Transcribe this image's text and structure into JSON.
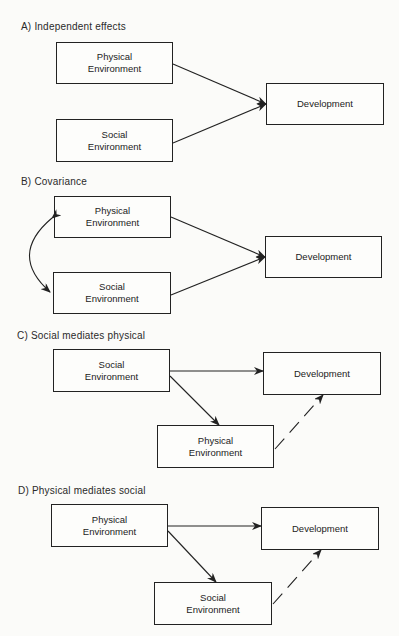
{
  "panels": [
    {
      "label": "A)  Independent effects",
      "boxes": {
        "physical": [
          "Physical",
          "Environment"
        ],
        "social": [
          "Social",
          "Environment"
        ],
        "development": "Development"
      }
    },
    {
      "label": "B)  Covariance",
      "boxes": {
        "physical": [
          "Physical",
          "Environment"
        ],
        "social": [
          "Social",
          "Environment"
        ],
        "development": "Development"
      }
    },
    {
      "label": "C)  Social mediates physical",
      "boxes": {
        "social": [
          "Social",
          "Environment"
        ],
        "physical": [
          "Physical",
          "Environment"
        ],
        "development": "Development"
      }
    },
    {
      "label": "D)  Physical mediates social",
      "boxes": {
        "physical": [
          "Physical",
          "Environment"
        ],
        "social": [
          "Social",
          "Environment"
        ],
        "development": "Development"
      }
    }
  ],
  "colors": {
    "ink": "#222222",
    "background": "#fbfbf9"
  }
}
